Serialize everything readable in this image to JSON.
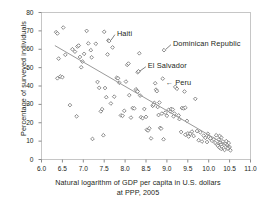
{
  "chart_data": {
    "type": "scatter",
    "title": "",
    "xlabel": "Natural logarithm of GDP per capita in U.S. dollars at PPP, 2005",
    "xlabel_line1": "Natural logarithm of GDP per capita in U.S. dollars",
    "xlabel_line2": "at PPP, 2005",
    "ylabel": "Percentage of surveyed individuals",
    "xlim": [
      6.0,
      11.0
    ],
    "ylim": [
      0,
      80
    ],
    "xticks": [
      "6.0",
      "6.5",
      "7.0",
      "7.5",
      "8.0",
      "8.5",
      "9.0",
      "9.5",
      "10.0",
      "10.5",
      "11.0"
    ],
    "xtick_values": [
      6.0,
      6.5,
      7.0,
      7.5,
      8.0,
      8.5,
      9.0,
      9.5,
      10.0,
      10.5,
      11.0
    ],
    "yticks": [
      "0",
      "10",
      "20",
      "30",
      "40",
      "50",
      "60",
      "70",
      "80"
    ],
    "ytick_values": [
      0,
      10,
      20,
      30,
      40,
      50,
      60,
      70,
      80
    ],
    "grid": false,
    "legend": "none",
    "marker": "open-diamond",
    "marker_color": "#6e6e6e",
    "trendline": {
      "type": "linear",
      "x_start": 6.32,
      "y_start": 62.0,
      "x_end": 10.52,
      "y_end": 6.5,
      "color": "#9a9a9a"
    },
    "annotations": [
      {
        "label": "Haiti",
        "x": 7.62,
        "y": 64.5,
        "label_x": 7.78,
        "label_y": 68.5,
        "leader": true,
        "arrow": false
      },
      {
        "label": "Dominican Republic",
        "x": 8.93,
        "y": 59.5,
        "label_x": 9.12,
        "label_y": 63.0,
        "leader": true,
        "arrow": false
      },
      {
        "label": "El Salvador",
        "x": 8.3,
        "y": 47.5,
        "label_x": 8.52,
        "label_y": 51.0,
        "leader": true,
        "arrow": false
      },
      {
        "label": "Peru",
        "x": 8.72,
        "y": 41.5,
        "label_x": 8.92,
        "label_y": 41.5,
        "leader": false,
        "arrow": true
      }
    ],
    "points": [
      [
        6.35,
        69.3
      ],
      [
        6.38,
        68.6
      ],
      [
        6.52,
        71.8
      ],
      [
        6.41,
        54.9
      ],
      [
        6.45,
        45.2
      ],
      [
        6.38,
        44.2
      ],
      [
        6.5,
        44.8
      ],
      [
        6.57,
        57.0
      ],
      [
        6.68,
        29.6
      ],
      [
        6.74,
        60.0
      ],
      [
        6.8,
        58.7
      ],
      [
        6.84,
        23.5
      ],
      [
        6.86,
        61.5
      ],
      [
        6.89,
        62.0
      ],
      [
        6.92,
        55.8
      ],
      [
        6.95,
        50.2
      ],
      [
        6.98,
        53.3
      ],
      [
        7.02,
        57.5
      ],
      [
        7.08,
        70.0
      ],
      [
        7.12,
        63.2
      ],
      [
        7.18,
        59.5
      ],
      [
        7.2,
        55.6
      ],
      [
        7.22,
        11.2
      ],
      [
        7.3,
        63.0
      ],
      [
        7.34,
        42.2
      ],
      [
        7.38,
        39.0
      ],
      [
        7.42,
        26.2
      ],
      [
        7.45,
        27.4
      ],
      [
        7.48,
        13.2
      ],
      [
        7.5,
        69.5
      ],
      [
        7.52,
        38.9
      ],
      [
        7.55,
        33.9
      ],
      [
        7.58,
        57.2
      ],
      [
        7.6,
        64.8
      ],
      [
        7.62,
        64.5
      ],
      [
        7.66,
        30.5
      ],
      [
        7.7,
        61.0
      ],
      [
        7.74,
        34.2
      ],
      [
        7.8,
        44.5
      ],
      [
        7.83,
        44.2
      ],
      [
        7.86,
        41.8
      ],
      [
        7.9,
        24.0
      ],
      [
        7.94,
        23.8
      ],
      [
        7.98,
        26.5
      ],
      [
        8.02,
        42.4
      ],
      [
        8.05,
        51.5
      ],
      [
        8.08,
        52.2
      ],
      [
        8.1,
        35.0
      ],
      [
        8.14,
        22.8
      ],
      [
        8.18,
        28.0
      ],
      [
        8.22,
        27.8
      ],
      [
        8.26,
        38.2
      ],
      [
        8.28,
        37.5
      ],
      [
        8.3,
        37.0
      ],
      [
        8.3,
        47.5
      ],
      [
        8.32,
        48.0
      ],
      [
        8.34,
        57.8
      ],
      [
        8.36,
        34.8
      ],
      [
        8.38,
        23.0
      ],
      [
        8.42,
        22.5
      ],
      [
        8.46,
        27.5
      ],
      [
        8.5,
        23.2
      ],
      [
        8.52,
        16.2
      ],
      [
        8.55,
        15.8
      ],
      [
        8.58,
        17.0
      ],
      [
        8.62,
        11.5
      ],
      [
        8.66,
        29.2
      ],
      [
        8.7,
        30.8
      ],
      [
        8.72,
        41.5
      ],
      [
        8.74,
        38.0
      ],
      [
        8.76,
        37.2
      ],
      [
        8.78,
        28.6
      ],
      [
        8.8,
        24.2
      ],
      [
        8.84,
        17.2
      ],
      [
        8.86,
        16.8
      ],
      [
        8.88,
        25.0
      ],
      [
        8.9,
        44.0
      ],
      [
        8.92,
        11.0
      ],
      [
        8.93,
        59.5
      ],
      [
        8.96,
        25.5
      ],
      [
        9.0,
        23.8
      ],
      [
        9.04,
        27.0
      ],
      [
        9.08,
        26.2
      ],
      [
        9.1,
        27.5
      ],
      [
        9.14,
        27.2
      ],
      [
        9.16,
        23.5
      ],
      [
        9.18,
        25.0
      ],
      [
        9.2,
        39.5
      ],
      [
        9.24,
        38.5
      ],
      [
        9.28,
        24.0
      ],
      [
        9.3,
        22.0
      ],
      [
        9.34,
        15.0
      ],
      [
        9.36,
        28.0
      ],
      [
        9.4,
        27.8
      ],
      [
        9.42,
        37.0
      ],
      [
        9.44,
        13.5
      ],
      [
        9.48,
        21.0
      ],
      [
        9.5,
        14.2
      ],
      [
        9.52,
        12.5
      ],
      [
        9.56,
        14.0
      ],
      [
        9.6,
        15.2
      ],
      [
        9.64,
        12.8
      ],
      [
        9.68,
        33.0
      ],
      [
        9.72,
        15.5
      ],
      [
        9.76,
        10.5
      ],
      [
        9.8,
        14.8
      ],
      [
        9.84,
        9.8
      ],
      [
        9.88,
        13.0
      ],
      [
        9.92,
        11.8
      ],
      [
        9.96,
        9.5
      ],
      [
        10.0,
        12.2
      ],
      [
        10.04,
        11.5
      ],
      [
        10.08,
        10.2
      ],
      [
        10.12,
        11.0
      ],
      [
        10.16,
        9.0
      ],
      [
        10.18,
        13.2
      ],
      [
        10.2,
        8.2
      ],
      [
        10.22,
        7.5
      ],
      [
        10.24,
        10.8
      ],
      [
        10.26,
        6.5
      ],
      [
        10.28,
        9.2
      ],
      [
        10.3,
        5.8
      ],
      [
        10.3,
        8.0
      ],
      [
        10.32,
        7.0
      ],
      [
        10.34,
        9.8
      ],
      [
        10.36,
        6.2
      ],
      [
        10.38,
        5.2
      ],
      [
        10.4,
        8.5
      ],
      [
        10.42,
        10.0
      ],
      [
        10.44,
        7.8
      ],
      [
        10.46,
        6.0
      ],
      [
        10.48,
        9.0
      ],
      [
        10.5,
        6.8
      ],
      [
        10.52,
        5.0
      ],
      [
        10.3,
        12.0
      ],
      [
        10.26,
        12.8
      ],
      [
        9.98,
        14.0
      ],
      [
        9.44,
        28.2
      ],
      [
        8.82,
        31.0
      ],
      [
        8.68,
        29.8
      ]
    ]
  }
}
